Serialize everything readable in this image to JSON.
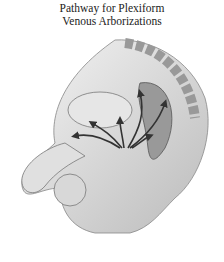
{
  "title": {
    "line1": "Pathway  for Plexiform",
    "line2": "Venous Arborizations"
  },
  "illustration": {
    "subject": "sagittal-section-male-pelvis",
    "style": "grayscale",
    "arrows_color": "#333333"
  }
}
